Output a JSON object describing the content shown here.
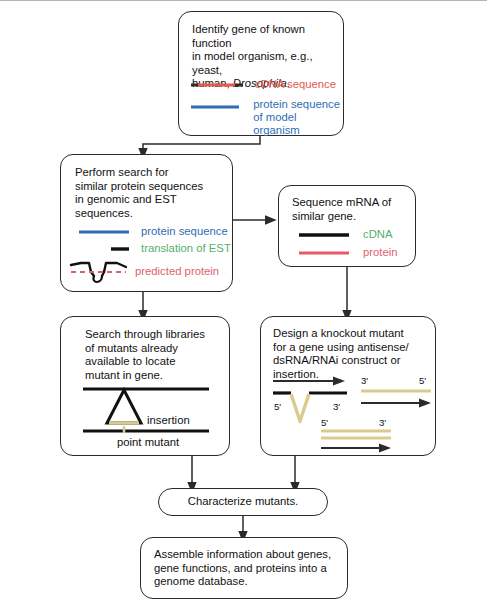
{
  "diagram": {
    "colors": {
      "cdna_red": "#e8584d",
      "protein_blue": "#2e6db4",
      "translation_green": "#56b06a",
      "predicted_pink": "#e0616e",
      "dna_black": "#111111",
      "construct_tan": "#d9cb8e",
      "box_border": "#2b2b2b"
    },
    "boxes": {
      "identify": {
        "text": "Identify gene of known function\nin model organism, e.g., yeast,\nhuman, ",
        "text_italic": "Drosophila",
        "text_tail": ".",
        "legend": [
          {
            "label": "cDNA sequence",
            "color_name": "cdna_red",
            "style": "solid-red-dark-ends"
          },
          {
            "label": "protein sequence\nof model organism",
            "color_name": "protein_blue",
            "style": "solid-blue"
          }
        ]
      },
      "search_similar": {
        "text": "Perform search for\nsimilar protein sequences\nin genomic and EST\nsequences.",
        "legend": [
          {
            "label": "protein sequence",
            "color_name": "protein_blue",
            "style": "solid-blue-long"
          },
          {
            "label": "translation of EST",
            "color_name": "translation_green",
            "style": "short-black-dash"
          },
          {
            "label": "predicted protein",
            "color_name": "predicted_pink",
            "style": "gene-with-intron-loop"
          }
        ]
      },
      "sequence_mrna": {
        "text": "Sequence mRNA of\nsimilar gene.",
        "legend": [
          {
            "label": "cDNA",
            "color_name": "translation_green",
            "style": "solid-black"
          },
          {
            "label": "protein",
            "color_name": "predicted_pink",
            "style": "solid-pink"
          }
        ]
      },
      "search_libraries": {
        "text": "Search through libraries\nof mutants already\navailable to locate\nmutant in gene.",
        "annotations": [
          {
            "label": "insertion"
          },
          {
            "label": "point mutant"
          }
        ]
      },
      "knockout": {
        "text": "Design a knockout mutant\nfor a gene using antisense/\ndsRNA/RNAi construct or\ninsertion.",
        "annotations": [
          {
            "label": "5'"
          },
          {
            "label": "3'"
          },
          {
            "label": "3'"
          },
          {
            "label": "5'"
          },
          {
            "label": "5'"
          },
          {
            "label": "3'"
          }
        ]
      },
      "characterize": {
        "text": "Characterize mutants."
      },
      "assemble": {
        "text": "Assemble information about genes,\ngene functions, and proteins into a\ngenome database."
      }
    }
  }
}
